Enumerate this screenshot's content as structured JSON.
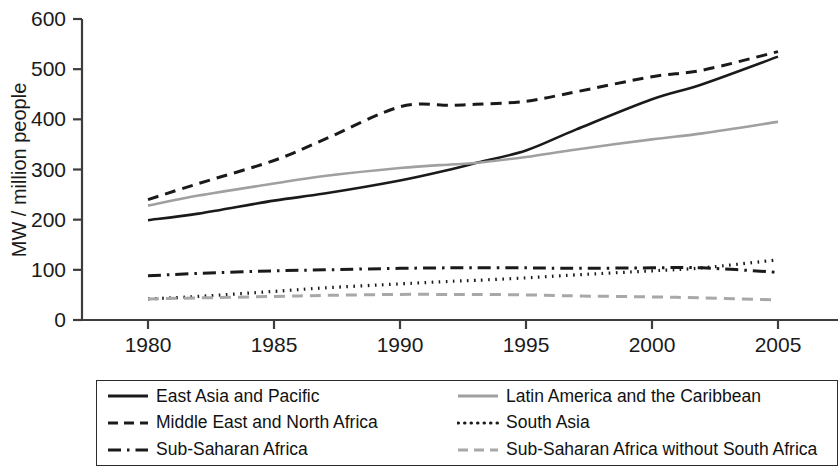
{
  "chart_data": {
    "type": "line",
    "title": "",
    "xlabel": "",
    "ylabel": "MW / million people",
    "xlim": [
      1978.5,
      2006.5
    ],
    "ylim": [
      0,
      600
    ],
    "xticks": [
      1980,
      1985,
      1990,
      1995,
      2000,
      2005
    ],
    "yticks": [
      0,
      100,
      200,
      300,
      400,
      500,
      600
    ],
    "grid": false,
    "legend_position": "below-axes",
    "x": [
      1980,
      1982,
      1985,
      1987,
      1990,
      1992,
      1993,
      1995,
      1997,
      2000,
      2002,
      2005
    ],
    "series": [
      {
        "name": "East Asia and Pacific",
        "color": "#1a1a1a",
        "dash": "solid",
        "values": [
          199,
          212,
          238,
          252,
          278,
          300,
          313,
          338,
          380,
          440,
          470,
          525
        ]
      },
      {
        "name": "Latin America and the Caribbean",
        "color": "#a0a0a0",
        "dash": "solid",
        "values": [
          228,
          248,
          272,
          287,
          303,
          310,
          313,
          325,
          340,
          360,
          372,
          395
        ]
      },
      {
        "name": "Middle East and North Africa",
        "color": "#1a1a1a",
        "dash": "dashed",
        "values": [
          240,
          272,
          318,
          360,
          425,
          428,
          430,
          436,
          455,
          485,
          498,
          535
        ]
      },
      {
        "name": "South Asia",
        "color": "#1a1a1a",
        "dash": "dotted",
        "values": [
          42,
          47,
          57,
          64,
          72,
          77,
          79,
          84,
          90,
          98,
          104,
          120
        ]
      },
      {
        "name": "Sub-Saharan Africa",
        "color": "#1a1a1a",
        "dash": "dashdot",
        "values": [
          88,
          93,
          98,
          100,
          103,
          104,
          104,
          104,
          103,
          104,
          104,
          95
        ]
      },
      {
        "name": "Sub-Saharan Africa without South Africa",
        "color": "#a8a8a8",
        "dash": "dashed",
        "values": [
          42,
          44,
          47,
          49,
          51,
          51,
          51,
          50,
          48,
          46,
          44,
          40
        ]
      }
    ]
  },
  "axes": {
    "ylabel": "MW / million people",
    "ytick_labels": [
      "0",
      "100",
      "200",
      "300",
      "400",
      "500",
      "600"
    ],
    "xtick_labels": [
      "1980",
      "1985",
      "1990",
      "1995",
      "2000",
      "2005"
    ]
  },
  "legend": {
    "items": [
      {
        "label": "East Asia and Pacific",
        "swatch": "solid-black-line-icon",
        "color": "#1a1a1a",
        "dash": "solid"
      },
      {
        "label": "Latin America and the Caribbean",
        "swatch": "solid-gray-line-icon",
        "color": "#a0a0a0",
        "dash": "solid"
      },
      {
        "label": "Middle East and North Africa",
        "swatch": "dashed-black-line-icon",
        "color": "#1a1a1a",
        "dash": "dashed"
      },
      {
        "label": "South Asia",
        "swatch": "dotted-black-line-icon",
        "color": "#1a1a1a",
        "dash": "dotted"
      },
      {
        "label": "Sub-Saharan Africa",
        "swatch": "dashdot-black-line-icon",
        "color": "#1a1a1a",
        "dash": "dashdot"
      },
      {
        "label": "Sub-Saharan Africa without South Africa",
        "swatch": "dashed-gray-line-icon",
        "color": "#a8a8a8",
        "dash": "dashed"
      }
    ]
  }
}
